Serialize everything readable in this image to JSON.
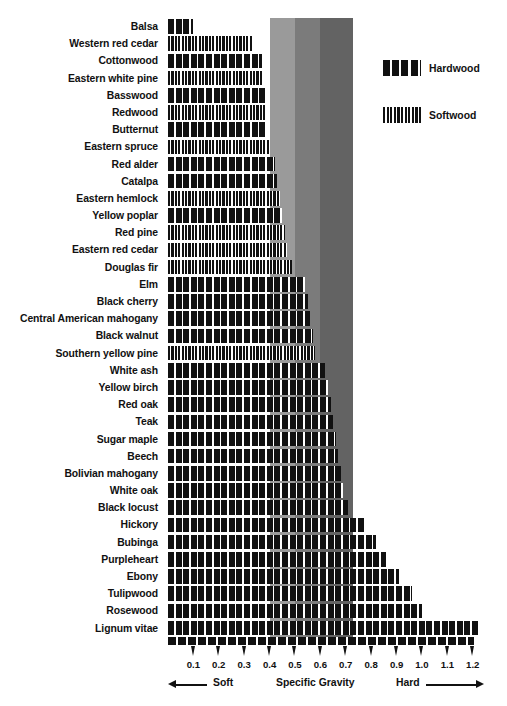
{
  "chart_data": {
    "type": "bar",
    "orientation": "horizontal",
    "title": "",
    "xlabel": "Specific Gravity",
    "ylabel": "",
    "xlim": [
      0.0,
      1.26
    ],
    "grid": false,
    "tick_labels": [
      "0.1",
      "0.2",
      "0.3",
      "0.4",
      "0.5",
      "0.6",
      "0.7",
      "0.8",
      "0.9",
      "1.0",
      "1.1",
      "1.2"
    ],
    "tick_values": [
      0.1,
      0.2,
      0.3,
      0.4,
      0.5,
      0.6,
      0.7,
      0.8,
      0.9,
      1.0,
      1.1,
      1.2
    ],
    "legend_position": "right",
    "legend": [
      {
        "name": "Hardwood",
        "pattern": "thick-vertical-bars"
      },
      {
        "name": "Softwood",
        "pattern": "thin-vertical-stripes"
      }
    ],
    "bands": [
      {
        "from": 0.4,
        "to": 0.5,
        "color": "#9a9a9a"
      },
      {
        "from": 0.5,
        "to": 0.6,
        "color": "#7b7b7b"
      },
      {
        "from": 0.6,
        "to": 0.73,
        "color": "#636363"
      }
    ],
    "categories": [
      "Balsa",
      "Western red cedar",
      "Cottonwood",
      "Eastern white pine",
      "Basswood",
      "Redwood",
      "Butternut",
      "Eastern spruce",
      "Red alder",
      "Catalpa",
      "Eastern hemlock",
      "Yellow poplar",
      "Red pine",
      "Eastern red cedar",
      "Douglas fir",
      "Elm",
      "Black cherry",
      "Central American mahogany",
      "Black walnut",
      "Southern yellow pine",
      "White ash",
      "Yellow birch",
      "Red oak",
      "Teak",
      "Sugar maple",
      "Beech",
      "Bolivian mahogany",
      "White oak",
      "Black locust",
      "Hickory",
      "Bubinga",
      "Purpleheart",
      "Ebony",
      "Tulipwood",
      "Rosewood",
      "Lignum vitae"
    ],
    "values": [
      0.1,
      0.33,
      0.37,
      0.37,
      0.38,
      0.38,
      0.39,
      0.4,
      0.42,
      0.43,
      0.44,
      0.45,
      0.46,
      0.47,
      0.49,
      0.54,
      0.55,
      0.56,
      0.57,
      0.58,
      0.62,
      0.63,
      0.64,
      0.65,
      0.66,
      0.67,
      0.68,
      0.69,
      0.71,
      0.78,
      0.82,
      0.86,
      0.91,
      0.96,
      1.0,
      1.22
    ],
    "types": [
      "hardwood",
      "softwood",
      "hardwood",
      "softwood",
      "hardwood",
      "softwood",
      "hardwood",
      "softwood",
      "hardwood",
      "hardwood",
      "softwood",
      "hardwood",
      "softwood",
      "softwood",
      "softwood",
      "hardwood",
      "hardwood",
      "hardwood",
      "hardwood",
      "softwood",
      "hardwood",
      "hardwood",
      "hardwood",
      "hardwood",
      "hardwood",
      "hardwood",
      "hardwood",
      "hardwood",
      "hardwood",
      "hardwood",
      "hardwood",
      "hardwood",
      "hardwood",
      "hardwood",
      "hardwood",
      "hardwood"
    ]
  },
  "footer": {
    "soft_label": "Soft",
    "axis_label": "Specific Gravity",
    "hard_label": "Hard"
  },
  "legend": {
    "hardwood_label": "Hardwood",
    "softwood_label": "Softwood"
  },
  "colors": {
    "bar": "#111111",
    "band_light": "#9a9a9a",
    "band_mid": "#7b7b7b",
    "band_dark": "#636363",
    "background": "#ffffff"
  }
}
